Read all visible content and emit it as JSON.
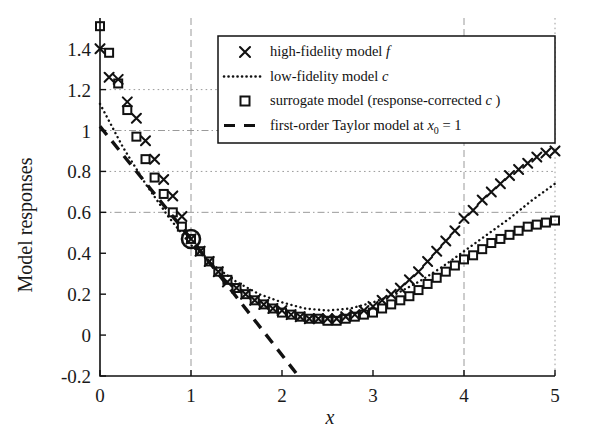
{
  "chart_data": {
    "type": "line",
    "title": "",
    "xlabel": "x",
    "ylabel": "Model responses",
    "xlim": [
      0,
      5
    ],
    "ylim": [
      -0.2,
      1.55
    ],
    "xticks": [
      "0",
      "1",
      "2",
      "3",
      "4",
      "5"
    ],
    "xtick_values": [
      0,
      1,
      2,
      3,
      4,
      5
    ],
    "yticks": [
      "-0.2",
      "0",
      "0.2",
      "0.4",
      "0.6",
      "0.8",
      "1",
      "1.2",
      "1.4"
    ],
    "ytick_values": [
      -0.2,
      0,
      0.2,
      0.4,
      0.6,
      0.8,
      1.0,
      1.2,
      1.4
    ],
    "grid": "dotted horizontal at 0.6, 0.8, 1.0, 1.2 and dashed vertical at 1, 4, 5",
    "gridlines_h": [
      0.6,
      0.8,
      1.0,
      1.2
    ],
    "gridlines_v": [
      1,
      4,
      5
    ],
    "legend_position": "upper right inside axes",
    "annotation_point": {
      "x": 1,
      "y": 0.47,
      "marker": "circle",
      "label": ""
    },
    "series": [
      {
        "name": "high-fidelity model f",
        "marker": "x",
        "linestyle": "none",
        "color": "#111111",
        "x": [
          0.0,
          0.1,
          0.2,
          0.3,
          0.4,
          0.5,
          0.6,
          0.7,
          0.8,
          0.9,
          1.0,
          1.1,
          1.2,
          1.3,
          1.4,
          1.5,
          1.6,
          1.7,
          1.8,
          1.9,
          2.0,
          2.1,
          2.2,
          2.3,
          2.4,
          2.5,
          2.6,
          2.7,
          2.8,
          2.9,
          3.0,
          3.1,
          3.2,
          3.3,
          3.4,
          3.5,
          3.6,
          3.7,
          3.8,
          3.9,
          4.0,
          4.1,
          4.2,
          4.3,
          4.4,
          4.5,
          4.6,
          4.7,
          4.8,
          4.9,
          5.0
        ],
        "y": [
          1.4,
          1.26,
          1.25,
          1.14,
          1.06,
          0.95,
          0.86,
          0.76,
          0.68,
          0.58,
          0.47,
          0.41,
          0.36,
          0.31,
          0.26,
          0.23,
          0.2,
          0.17,
          0.15,
          0.13,
          0.12,
          0.1,
          0.09,
          0.08,
          0.08,
          0.08,
          0.08,
          0.09,
          0.1,
          0.12,
          0.14,
          0.17,
          0.2,
          0.23,
          0.27,
          0.31,
          0.36,
          0.41,
          0.46,
          0.51,
          0.57,
          0.61,
          0.66,
          0.7,
          0.74,
          0.78,
          0.81,
          0.84,
          0.87,
          0.89,
          0.9
        ]
      },
      {
        "name": "low-fidelity model c",
        "marker": "none",
        "linestyle": "dotted",
        "color": "#111111",
        "x": [
          0.0,
          0.25,
          0.5,
          0.75,
          1.0,
          1.25,
          1.5,
          1.75,
          2.0,
          2.25,
          2.5,
          2.75,
          3.0,
          3.25,
          3.5,
          3.75,
          4.0,
          4.25,
          4.5,
          4.75,
          5.0
        ],
        "y": [
          1.13,
          0.92,
          0.74,
          0.58,
          0.44,
          0.34,
          0.26,
          0.2,
          0.16,
          0.13,
          0.12,
          0.13,
          0.16,
          0.2,
          0.26,
          0.33,
          0.41,
          0.49,
          0.57,
          0.66,
          0.74
        ]
      },
      {
        "name": "surrogate model (response-corrected c)",
        "marker": "square",
        "linestyle": "none",
        "color": "#111111",
        "x": [
          0.0,
          0.1,
          0.2,
          0.3,
          0.4,
          0.5,
          0.6,
          0.7,
          0.8,
          0.9,
          1.0,
          1.1,
          1.2,
          1.3,
          1.4,
          1.5,
          1.6,
          1.7,
          1.8,
          1.9,
          2.0,
          2.1,
          2.2,
          2.3,
          2.4,
          2.5,
          2.6,
          2.7,
          2.8,
          2.9,
          3.0,
          3.1,
          3.2,
          3.3,
          3.4,
          3.5,
          3.6,
          3.7,
          3.8,
          3.9,
          4.0,
          4.1,
          4.2,
          4.3,
          4.4,
          4.5,
          4.6,
          4.7,
          4.8,
          4.9,
          5.0
        ],
        "y": [
          1.51,
          1.38,
          1.23,
          1.1,
          0.97,
          0.86,
          0.77,
          0.69,
          0.6,
          0.53,
          0.47,
          0.41,
          0.36,
          0.31,
          0.27,
          0.23,
          0.2,
          0.17,
          0.15,
          0.13,
          0.11,
          0.1,
          0.09,
          0.08,
          0.08,
          0.07,
          0.07,
          0.08,
          0.09,
          0.1,
          0.11,
          0.13,
          0.15,
          0.17,
          0.19,
          0.22,
          0.25,
          0.28,
          0.31,
          0.34,
          0.37,
          0.39,
          0.42,
          0.45,
          0.47,
          0.49,
          0.51,
          0.53,
          0.54,
          0.55,
          0.56
        ]
      },
      {
        "name": "first-order Taylor model at x0 = 1",
        "marker": "none",
        "linestyle": "dashed",
        "color": "#111111",
        "x": [
          0.0,
          1.0,
          2.18
        ],
        "y": [
          1.02,
          0.47,
          -0.2
        ]
      }
    ]
  },
  "legend": {
    "items": [
      {
        "marker": "x",
        "text_main": "high-fidelity model ",
        "text_italic": "f",
        "sub": ""
      },
      {
        "marker": "dotted",
        "text_main": "low-fidelity model ",
        "text_italic": "c",
        "sub": ""
      },
      {
        "marker": "square",
        "text_main": "surrogate model (response-corrected ",
        "text_italic": "c",
        "tail": " )",
        "sub": ""
      },
      {
        "marker": "dashed",
        "text_main": "first-order Taylor model at ",
        "text_italic": "x",
        "sub": "0",
        "tail": " = 1"
      }
    ]
  },
  "axes": {
    "y_title": "Model responses",
    "x_title": "x"
  },
  "colors": {
    "ink": "#111111",
    "grid": "#9a9a9a",
    "background": "#ffffff"
  }
}
